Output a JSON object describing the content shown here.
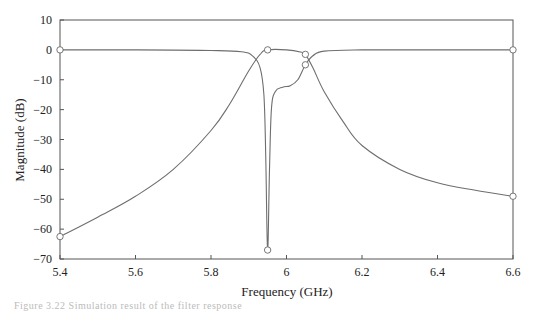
{
  "chart_data": {
    "type": "line",
    "title": "",
    "xlabel": "Frequency (GHz)",
    "ylabel": "Magnitude (dB)",
    "xlim": [
      5.4,
      6.6
    ],
    "ylim": [
      -70,
      10
    ],
    "xticks": [
      "5.4",
      "5.6",
      "5.8",
      "6",
      "6.2",
      "6.4",
      "6.6"
    ],
    "yticks": [
      "10",
      "0",
      "−10",
      "−20",
      "−30",
      "−40",
      "−50",
      "−60",
      "−70"
    ],
    "grid": false,
    "legend": null,
    "series": [
      {
        "name": "S21 (transmission)",
        "x": [
          5.4,
          5.5,
          5.6,
          5.7,
          5.8,
          5.85,
          5.9,
          5.93,
          5.95,
          6.0,
          6.04,
          6.05,
          6.07,
          6.1,
          6.15,
          6.2,
          6.3,
          6.4,
          6.5,
          6.6
        ],
        "y": [
          -62.5,
          -56,
          -49,
          -40,
          -27,
          -18,
          -7,
          -1.5,
          0,
          0,
          -0.8,
          -1.5,
          -6,
          -14,
          -24,
          -32,
          -40,
          -44.5,
          -47,
          -49
        ]
      },
      {
        "name": "S11 (reflection)",
        "x": [
          5.4,
          5.6,
          5.8,
          5.88,
          5.91,
          5.93,
          5.94,
          5.945,
          5.95,
          5.955,
          5.96,
          5.97,
          5.99,
          6.01,
          6.03,
          6.05,
          6.07,
          6.1,
          6.2,
          6.4,
          6.6
        ],
        "y": [
          0,
          0,
          -0.2,
          -0.6,
          -2,
          -6,
          -15,
          -35,
          -67,
          -40,
          -20,
          -14,
          -12.5,
          -12,
          -10,
          -5,
          -2,
          -0.4,
          0,
          0,
          0
        ]
      }
    ],
    "markers": [
      {
        "x": 5.4,
        "y": 0
      },
      {
        "x": 5.4,
        "y": -62.5
      },
      {
        "x": 5.95,
        "y": 0
      },
      {
        "x": 5.95,
        "y": -67
      },
      {
        "x": 6.05,
        "y": -1.5
      },
      {
        "x": 6.05,
        "y": -5
      },
      {
        "x": 6.6,
        "y": 0
      },
      {
        "x": 6.6,
        "y": -49
      }
    ]
  },
  "caption": "Figure 3.22  Simulation result of the filter response"
}
